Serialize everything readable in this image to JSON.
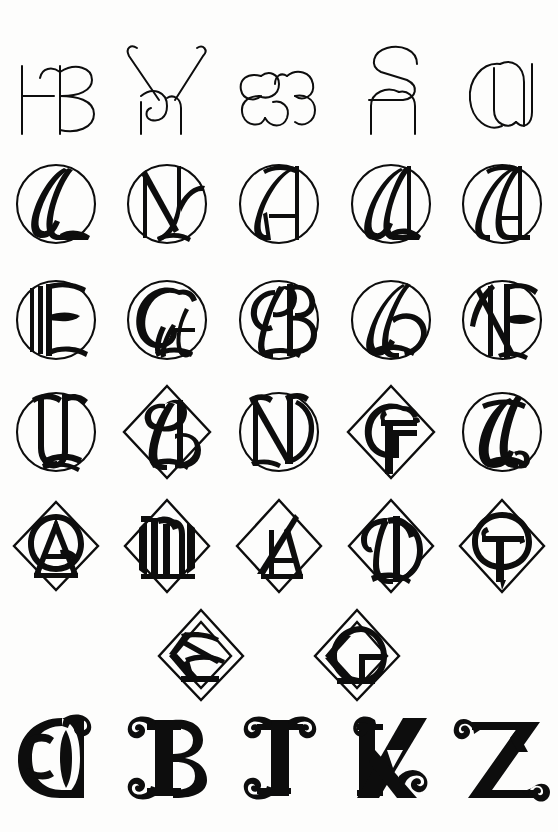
{
  "page": {
    "background_color": "#fdfdfc",
    "ink_color": "#0d0d0d",
    "width": 558,
    "height": 832,
    "medium": "pen-and-ink drawn letter specimen sheet",
    "total_glyphs": 32
  },
  "rows": [
    {
      "id": "row-1",
      "name": "open-script-ligature-row",
      "frame": "none",
      "top": 38,
      "height": 100,
      "description": "Five unframed open linear script ligatures drawn in a single uniform thin stroke.",
      "cells": [
        {
          "index": 1,
          "name": "glyph-he-ligature",
          "letters": "HE",
          "frame": "none",
          "style": "thin-line"
        },
        {
          "index": 2,
          "name": "glyph-y-ligature",
          "letters": "Y",
          "frame": "none",
          "style": "thin-line"
        },
        {
          "index": 3,
          "name": "glyph-ee-ligature",
          "letters": "EE",
          "frame": "none",
          "style": "thin-line"
        },
        {
          "index": 4,
          "name": "glyph-sn-ligature",
          "letters": "SN",
          "frame": "none",
          "style": "thin-line"
        },
        {
          "index": 5,
          "name": "glyph-cu-ligature",
          "letters": "CU",
          "frame": "none",
          "style": "thin-line"
        }
      ]
    },
    {
      "id": "row-2",
      "name": "circular-monogram-row-1",
      "frame": "circle",
      "top": 152,
      "height": 104,
      "description": "Five monograms enclosed in thin circles, calligraphic swelled strokes.",
      "cells": [
        {
          "index": 1,
          "name": "glyph-l-circle",
          "letters": "L",
          "frame": "circle",
          "style": "swelled-script"
        },
        {
          "index": 2,
          "name": "glyph-ny-circle",
          "letters": "NY",
          "frame": "circle",
          "style": "swelled-script"
        },
        {
          "index": 3,
          "name": "glyph-a-circle",
          "letters": "A",
          "frame": "circle",
          "style": "swelled-script"
        },
        {
          "index": 4,
          "name": "glyph-al-circle",
          "letters": "AL",
          "frame": "circle",
          "style": "swelled-script"
        },
        {
          "index": 5,
          "name": "glyph-ja-circle",
          "letters": "JA",
          "frame": "circle",
          "style": "swelled-script"
        }
      ]
    },
    {
      "id": "row-3",
      "name": "circular-monogram-row-2",
      "frame": "circle",
      "top": 268,
      "height": 104,
      "cells": [
        {
          "index": 1,
          "name": "glyph-e-circle",
          "letters": "E",
          "frame": "circle",
          "style": "swelled-script"
        },
        {
          "index": 2,
          "name": "glyph-gw-circle",
          "letters": "GW",
          "frame": "circle",
          "style": "swelled-script"
        },
        {
          "index": 3,
          "name": "glyph-b-circle",
          "letters": "B",
          "frame": "circle",
          "style": "swelled-script"
        },
        {
          "index": 4,
          "name": "glyph-h-circle",
          "letters": "H",
          "frame": "circle",
          "style": "swelled-script"
        },
        {
          "index": 5,
          "name": "glyph-nf-circle",
          "letters": "NF",
          "frame": "circle",
          "style": "swelled-script"
        }
      ]
    },
    {
      "id": "row-4",
      "name": "mixed-frame-row-1",
      "frame": "circle-and-diamond",
      "top": 380,
      "height": 104,
      "cells": [
        {
          "index": 1,
          "name": "glyph-u-circle",
          "letters": "U",
          "frame": "circle",
          "style": "swelled-script"
        },
        {
          "index": 2,
          "name": "glyph-sn-diamond",
          "letters": "SN",
          "frame": "diamond",
          "style": "swelled-script"
        },
        {
          "index": 3,
          "name": "glyph-n-circle",
          "letters": "N",
          "frame": "circle",
          "style": "swelled-script"
        },
        {
          "index": 4,
          "name": "glyph-gt-diamond",
          "letters": "GT",
          "frame": "diamond",
          "style": "roman-slab"
        },
        {
          "index": 5,
          "name": "glyph-l-circle-2",
          "letters": "L",
          "frame": "circle",
          "style": "swelled-script"
        }
      ]
    },
    {
      "id": "row-5",
      "name": "diamond-monogram-row",
      "frame": "diamond",
      "top": 496,
      "height": 100,
      "cells": [
        {
          "index": 1,
          "name": "glyph-qa-diamond",
          "letters": "QA",
          "frame": "diamond",
          "style": "roman-slab"
        },
        {
          "index": 2,
          "name": "glyph-m-diamond",
          "letters": "M",
          "frame": "diamond",
          "style": "blackletter"
        },
        {
          "index": 3,
          "name": "glyph-a-diamond",
          "letters": "A",
          "frame": "diamond",
          "style": "roman-slab"
        },
        {
          "index": 4,
          "name": "glyph-d-diamond",
          "letters": "D",
          "frame": "diamond",
          "style": "swelled-script"
        },
        {
          "index": 5,
          "name": "glyph-t-diamond",
          "letters": "T",
          "frame": "diamond",
          "style": "roman-slab"
        }
      ]
    },
    {
      "id": "row-6",
      "name": "diamond-pair-row",
      "frame": "double-diamond",
      "top": 606,
      "height": 98,
      "cells": [
        {
          "index": 1,
          "name": "glyph-k-double-diamond",
          "letters": "K",
          "frame": "double-diamond",
          "style": "heavy-slab"
        },
        {
          "index": 2,
          "name": "glyph-g-double-diamond",
          "letters": "G",
          "frame": "double-diamond",
          "style": "heavy-slab"
        }
      ]
    },
    {
      "id": "row-7",
      "name": "bold-initial-row",
      "frame": "none",
      "top": 710,
      "height": 96,
      "description": "Five heavy solid-black display initials with curled spiral serif terminals.",
      "cells": [
        {
          "index": 1,
          "name": "glyph-o-bold",
          "letters": "O",
          "frame": "none",
          "style": "bold-curled-serif"
        },
        {
          "index": 2,
          "name": "glyph-b-bold",
          "letters": "B",
          "frame": "none",
          "style": "bold-curled-serif"
        },
        {
          "index": 3,
          "name": "glyph-t-bold",
          "letters": "T",
          "frame": "none",
          "style": "bold-curled-serif"
        },
        {
          "index": 4,
          "name": "glyph-k-bold",
          "letters": "K",
          "frame": "none",
          "style": "bold-curled-serif"
        },
        {
          "index": 5,
          "name": "glyph-z-bold",
          "letters": "Z",
          "frame": "none",
          "style": "bold-curled-serif"
        }
      ]
    }
  ]
}
